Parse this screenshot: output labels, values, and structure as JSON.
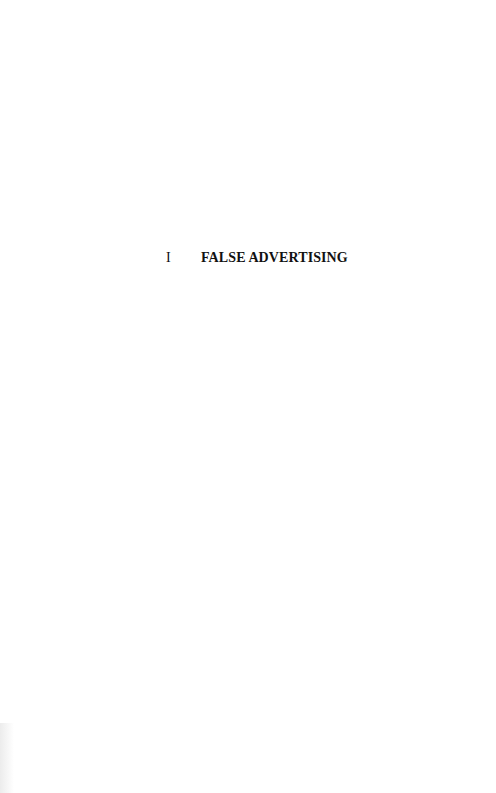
{
  "document": {
    "chapter": {
      "number": "I",
      "title": "FALSE ADVERTISING"
    }
  }
}
